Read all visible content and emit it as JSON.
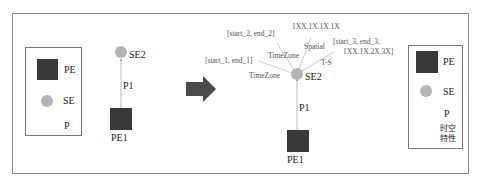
{
  "left_legend": {
    "pe_label": "PE",
    "se_label": "SE",
    "p_label": "P"
  },
  "before": {
    "se_node": "SE2",
    "edge_label": "P1",
    "pe_node": "PE1"
  },
  "transform_arrow": "right-arrow",
  "after": {
    "se_node": "SE2",
    "edge_label": "P1",
    "pe_node": "PE1",
    "attributes": [
      {
        "edge": "TimeZone",
        "value": "[start_1, end_1]"
      },
      {
        "edge": "TimeZone",
        "value": "[start_2, end_2]"
      },
      {
        "edge": "Spatial",
        "value": "1XX.1X.1X.1X"
      },
      {
        "edge": "T-S",
        "value_line1": "[start_3, end_3,",
        "value_line2": "1XX.1X.2X.3X]"
      }
    ]
  },
  "right_legend": {
    "pe_label": "PE",
    "se_label": "SE",
    "p_label": "P",
    "st_label_line1": "时空",
    "st_label_line2": "特性"
  },
  "colors": {
    "pe_fill": "#3a3a3a",
    "se_fill": "#b5b5b5",
    "arrow_fill": "#4a4a4a",
    "edge_line": "#bbbbbb",
    "attr_line": "#d5d5d5"
  }
}
